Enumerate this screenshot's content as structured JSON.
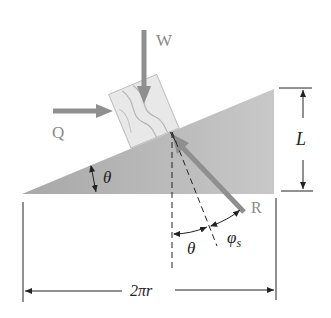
{
  "diagram": {
    "type": "physics-free-body",
    "labels": {
      "weight": "W",
      "horizontal_force": "Q",
      "reaction": "R",
      "height": "L",
      "incline_angle": "θ",
      "normal_angle": "θ",
      "friction_angle": "φ",
      "friction_subscript": "s",
      "base_length": "2πr"
    },
    "colors": {
      "wedge_dark": "#9a9a9a",
      "wedge_light": "#d8d8d8",
      "force_arrow": "#8f8f8f",
      "block_fill": "#e6e6e6",
      "line": "#222222"
    }
  }
}
